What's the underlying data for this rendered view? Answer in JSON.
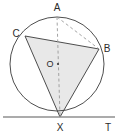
{
  "figure": {
    "kind": "circle-tangent-geometry-diagram",
    "background_color": "#ffffff",
    "stroke_color": "#3a3a3a",
    "dash_color": "#9a9a9a",
    "fill_color": "#e8e8e8",
    "tangent_color": "#8f8f8f",
    "labels": {
      "apex_top": "A",
      "upper_left": "C",
      "right": "B",
      "center": "O",
      "tangency": "X",
      "tangent_end": "T"
    },
    "geometry": {
      "circle": {
        "cx": 57,
        "cy": 64,
        "r": 47
      },
      "points": {
        "A": {
          "x": 57,
          "y": 17
        },
        "C": {
          "x": 25,
          "y": 36
        },
        "B": {
          "x": 99,
          "y": 49
        },
        "O": {
          "x": 58,
          "y": 64
        },
        "X": {
          "x": 60,
          "y": 117
        },
        "T_line_y": 117
      },
      "shaded_triangle": "C-B-X",
      "dashed_segments": [
        "A-X",
        "A-B"
      ],
      "solid_segments": [
        "C-B",
        "C-X",
        "B-X"
      ],
      "tangent_line": {
        "x1": 3,
        "x2": 115,
        "y": 117
      }
    },
    "label_positions": {
      "A": {
        "x": 57,
        "y": 11
      },
      "C": {
        "x": 16,
        "y": 37
      },
      "B": {
        "x": 106,
        "y": 52
      },
      "O": {
        "x": 50,
        "y": 67
      },
      "X": {
        "x": 60,
        "y": 132
      },
      "T": {
        "x": 108,
        "y": 131
      }
    }
  }
}
